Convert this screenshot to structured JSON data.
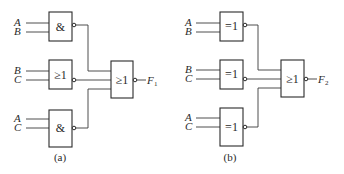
{
  "diagrams": {
    "a": {
      "caption": "(a)",
      "gates": [
        {
          "symbol": "&",
          "inputs": [
            "A",
            "B"
          ],
          "inverted_output": true
        },
        {
          "symbol": "≥1",
          "inputs": [
            "B",
            "C"
          ],
          "inverted_output": true
        },
        {
          "symbol": "&",
          "inputs": [
            "A",
            "C"
          ],
          "inverted_output": true
        }
      ],
      "output_gate": {
        "symbol": "≥1",
        "inverted_output": true,
        "output_label": "F",
        "output_subscript": "1"
      }
    },
    "b": {
      "caption": "(b)",
      "gates": [
        {
          "symbol": "=1",
          "inputs": [
            "A",
            "B"
          ],
          "inverted_output": true
        },
        {
          "symbol": "=1",
          "inputs": [
            "B",
            "C"
          ],
          "inverted_output": true
        },
        {
          "symbol": "=1",
          "inputs": [
            "A",
            "C"
          ],
          "inverted_output": true
        }
      ],
      "output_gate": {
        "symbol": "≥1",
        "inverted_output": true,
        "output_label": "F",
        "output_subscript": "2"
      }
    }
  }
}
